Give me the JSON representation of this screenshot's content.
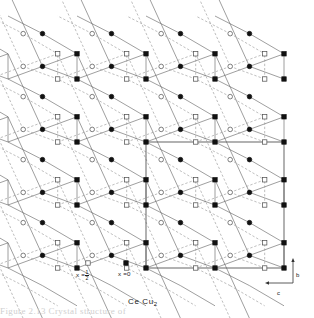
{
  "figure": {
    "title": "Ce Cu",
    "title_subscript": "2",
    "compound": "CeCu2",
    "caption_fragment": "Figure 2.13   Crystal structure of"
  },
  "legend": {
    "items": [
      {
        "symbol": "open-square",
        "label_prefix": "x =",
        "label_value": "1/2",
        "numerator": "1",
        "denominator": "2"
      },
      {
        "symbol": "filled-square",
        "label_prefix": "x =",
        "label_value": "0",
        "numerator": "",
        "denominator": ""
      }
    ],
    "open_square_x": 88,
    "open_square_y": 263,
    "filled_square_x": 126,
    "filled_square_y": 263,
    "text_half_x": 76,
    "text_half_y": 270,
    "text_zero_x": 118,
    "text_zero_y": 270
  },
  "axes": {
    "b_label": "b",
    "c_label": "c",
    "origin_x": 293,
    "origin_y": 283,
    "b_tip_y": 258,
    "c_tip_x": 265,
    "b_label_x": 296,
    "b_label_y": 272,
    "c_label_x": 277,
    "c_label_y": 290
  },
  "unit_cell": {
    "label": "unit-cell-outline",
    "x": 146,
    "y": 142,
    "width": 138,
    "height": 126,
    "stroke": "#555555",
    "stroke_width": 0.9
  },
  "style": {
    "bond_solid_color": "#6a6a6a",
    "bond_dashed_color": "#9a9a9a",
    "bond_width": 0.65,
    "dash_pattern": "2.4,1.9",
    "filled_fill": "#111111",
    "open_fill": "#ffffff",
    "open_stroke": "#4a4a4a",
    "marker_stroke_width": 0.7,
    "square_size": 4.4,
    "circle_radius": 2.3,
    "title_x": 128,
    "title_y": 297
  },
  "chart_data": {
    "type": "scatter",
    "title": "Ce Cu2",
    "xlabel": "c",
    "ylabel": "b",
    "legend": [
      "x = 1/2 (open)",
      "x = 0 (filled)"
    ],
    "lattice": {
      "cell_dx": 69,
      "cell_dy": 63,
      "origin_x": 146,
      "origin_y": 268,
      "columns": [
        -2,
        -1,
        0,
        1
      ],
      "rows": [
        -3,
        -2,
        -1,
        0
      ]
    },
    "motif": {
      "comment": "Fractional coordinates within one b-c cell, measured as (u along c to the left, v along b upward).",
      "sites": [
        {
          "id": "Ce-A",
          "symbol": "filled-square",
          "u": 0.0,
          "v": 0.0
        },
        {
          "id": "Ce-B",
          "symbol": "filled-square",
          "u": 0.0,
          "v": 0.4
        },
        {
          "id": "Ce-C",
          "symbol": "open-square",
          "u": 0.28,
          "v": 0.0
        },
        {
          "id": "Ce-D",
          "symbol": "open-square",
          "u": 0.28,
          "v": 0.4
        },
        {
          "id": "Cu-A",
          "symbol": "filled-circle",
          "u": 0.5,
          "v": 0.2
        },
        {
          "id": "Cu-B",
          "symbol": "filled-circle",
          "u": 0.5,
          "v": 0.72
        },
        {
          "id": "Cu-C",
          "symbol": "open-circle",
          "u": 0.78,
          "v": 0.2
        },
        {
          "id": "Cu-D",
          "symbol": "open-circle",
          "u": 0.78,
          "v": 0.72
        }
      ]
    },
    "bond_rules": [
      {
        "from": "Ce-A",
        "to": "Ce-B",
        "style": "solid"
      },
      {
        "from": "Ce-B",
        "to": "Cu-A",
        "style": "solid",
        "dc": 0,
        "dr": 0
      },
      {
        "from": "Ce-A",
        "to": "Cu-A",
        "style": "solid",
        "dc": 0,
        "dr": 0
      },
      {
        "from": "Cu-A",
        "to": "Ce-A",
        "style": "solid",
        "dc": 1,
        "dr": 0
      },
      {
        "from": "Cu-A",
        "to": "Ce-B",
        "style": "solid",
        "dc": 1,
        "dr": -1
      },
      {
        "from": "Cu-B",
        "to": "Ce-B",
        "style": "solid",
        "dc": 0,
        "dr": 0
      },
      {
        "from": "Cu-B",
        "to": "Ce-A",
        "style": "solid",
        "dc": 1,
        "dr": -1
      },
      {
        "from": "Ce-C",
        "to": "Ce-D",
        "style": "dashed"
      },
      {
        "from": "Ce-D",
        "to": "Cu-C",
        "style": "dashed",
        "dc": 0,
        "dr": 0
      },
      {
        "from": "Ce-C",
        "to": "Cu-C",
        "style": "dashed",
        "dc": 0,
        "dr": 0
      },
      {
        "from": "Cu-C",
        "to": "Ce-C",
        "style": "dashed",
        "dc": 1,
        "dr": 0
      },
      {
        "from": "Cu-C",
        "to": "Ce-D",
        "style": "dashed",
        "dc": 1,
        "dr": -1
      },
      {
        "from": "Cu-D",
        "to": "Ce-D",
        "style": "dashed",
        "dc": 0,
        "dr": 0
      },
      {
        "from": "Cu-D",
        "to": "Ce-C",
        "style": "dashed",
        "dc": 1,
        "dr": -1
      }
    ]
  }
}
